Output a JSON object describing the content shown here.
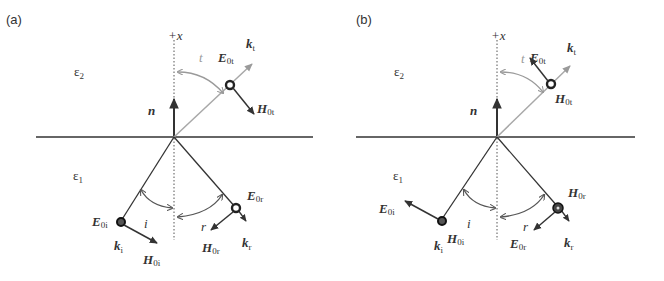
{
  "figure": {
    "panels": [
      {
        "id": "a",
        "label": "(a)",
        "axis_label": "+x",
        "medium_top": "ε",
        "medium_top_sub": "2",
        "medium_bottom": "ε",
        "medium_bottom_sub": "1",
        "normal": "n",
        "angle_t": "t",
        "angle_i": "i",
        "angle_r": "r",
        "E_t": "E",
        "E_t_sub": "0t",
        "H_t": "H",
        "H_t_sub": "0t",
        "k_t": "k",
        "k_t_sub": "t",
        "E_i": "E",
        "E_i_sub": "0i",
        "H_i": "H",
        "H_i_sub": "0i",
        "k_i": "k",
        "k_i_sub": "i",
        "E_r": "E",
        "E_r_sub": "0r",
        "H_r": "H",
        "H_r_sub": "0r",
        "k_r": "k",
        "k_r_sub": "r",
        "polarization": "E perpendicular to plane of incidence (out of page)"
      },
      {
        "id": "b",
        "label": "(b)",
        "axis_label": "+x",
        "medium_top": "ε",
        "medium_top_sub": "2",
        "medium_bottom": "ε",
        "medium_bottom_sub": "1",
        "normal": "n",
        "angle_t": "t",
        "angle_i": "i",
        "angle_r": "r",
        "E_t": "E",
        "E_t_sub": "0t",
        "H_t": "H",
        "H_t_sub": "0t",
        "k_t": "k",
        "k_t_sub": "t",
        "E_i": "E",
        "E_i_sub": "0i",
        "H_i": "H",
        "H_i_sub": "0i",
        "k_i": "k",
        "k_i_sub": "i",
        "E_r": "E",
        "E_r_sub": "0r",
        "H_r": "H",
        "H_r_sub": "0r",
        "k_r": "k",
        "k_r_sub": "r",
        "polarization": "H perpendicular to plane of incidence"
      }
    ],
    "colors": {
      "line": "#333333",
      "transmitted": "#a8a8a8",
      "text": "#333333"
    }
  }
}
